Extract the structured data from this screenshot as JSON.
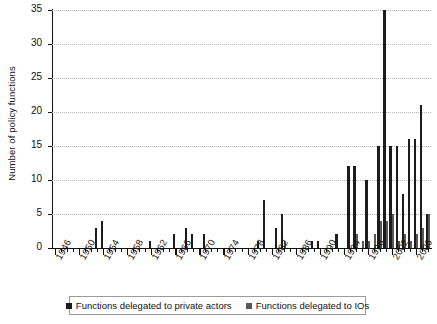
{
  "chart_data": {
    "type": "bar",
    "title": "",
    "xlabel": "",
    "ylabel": "Number of policy functions",
    "ylim": [
      0,
      35
    ],
    "ytick_labels": [
      "0",
      "5",
      "10",
      "15",
      "20",
      "25",
      "30",
      "35"
    ],
    "ytick_values": [
      0,
      5,
      10,
      15,
      20,
      25,
      30,
      35
    ],
    "grid": "horizontal-dotted",
    "legend_position": "bottom-center",
    "xlim": [
      1945.5,
      2008.5
    ],
    "xtick_labels": [
      "1946",
      "1950",
      "1954",
      "1958",
      "1962",
      "1966",
      "1970",
      "1974",
      "1978",
      "1982",
      "1986",
      "1990",
      "1994",
      "1998",
      "2002",
      "2006"
    ],
    "xtick_values": [
      1946,
      1950,
      1954,
      1958,
      1962,
      1966,
      1970,
      1974,
      1978,
      1982,
      1986,
      1990,
      1994,
      1998,
      2002,
      2006
    ],
    "minor_xtick_interval": 1,
    "x": [
      1946,
      1947,
      1948,
      1949,
      1950,
      1951,
      1952,
      1953,
      1954,
      1955,
      1956,
      1957,
      1958,
      1959,
      1960,
      1961,
      1962,
      1963,
      1964,
      1965,
      1966,
      1967,
      1968,
      1969,
      1970,
      1971,
      1972,
      1973,
      1974,
      1975,
      1976,
      1977,
      1978,
      1979,
      1980,
      1981,
      1982,
      1983,
      1984,
      1985,
      1986,
      1987,
      1988,
      1989,
      1990,
      1991,
      1992,
      1993,
      1994,
      1995,
      1996,
      1997,
      1998,
      1999,
      2000,
      2001,
      2002,
      2003,
      2004,
      2005,
      2006,
      2007,
      2008
    ],
    "series": [
      {
        "name": "Functions delegated to private actors",
        "color": "#1c1c1c",
        "values": [
          0,
          0,
          0,
          0,
          0,
          0,
          0,
          3,
          4,
          0,
          0,
          0,
          0,
          0,
          0,
          0,
          1,
          0,
          0,
          0,
          2,
          0,
          3,
          2,
          0,
          2,
          0,
          0,
          0,
          0,
          0,
          0,
          0,
          0,
          1,
          7,
          0,
          3,
          5,
          0,
          0,
          0,
          0,
          1,
          1,
          0,
          0,
          2,
          0,
          12,
          12,
          0,
          10,
          0,
          15,
          35,
          15,
          15,
          8,
          16,
          16,
          21,
          5
        ]
      },
      {
        "name": "Functions delegated to IOs",
        "color": "#585858",
        "values": [
          0,
          0,
          0,
          0,
          0,
          0,
          0,
          0,
          0,
          0,
          0,
          0,
          0,
          0,
          0,
          0,
          0,
          0,
          0,
          0,
          0,
          0,
          0,
          0,
          0,
          0,
          0,
          0,
          0,
          0,
          0,
          0,
          0,
          0,
          0,
          0,
          0,
          0,
          1,
          0,
          0,
          0,
          0,
          0,
          0,
          0,
          0,
          0,
          0,
          0,
          2,
          1,
          1,
          2,
          4,
          4,
          5,
          1,
          2,
          1,
          2,
          3,
          5
        ]
      }
    ]
  },
  "legend": {
    "items": [
      {
        "label": "Functions delegated to private actors",
        "color": "#1c1c1c"
      },
      {
        "label": "Functions delegated to IOs",
        "color": "#585858"
      }
    ]
  }
}
